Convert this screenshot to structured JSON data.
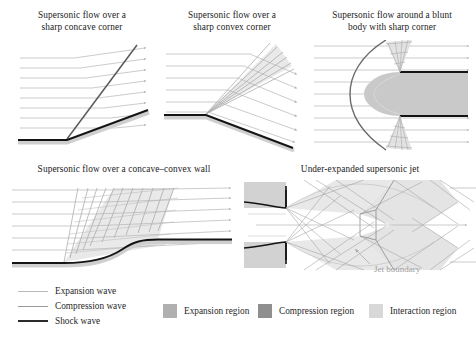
{
  "figure": {
    "background": "#ffffff",
    "width": 476,
    "height": 344
  },
  "colors": {
    "expansion_wave": "#bfbfbf",
    "compression_wave": "#9d9d9d",
    "shock_wave": "#262626",
    "expansion_region": "#b0b0b0",
    "compression_region": "#8f8f8f",
    "interaction_region": "#d8d8d8",
    "streamline": "#b5b5b5",
    "wall": "#1a1a1a",
    "wall_shadow": "#cccccc",
    "annotation": "#9e9e9e",
    "body_fill": "#c9c9c9",
    "text": "#1f1f1f"
  },
  "panels": [
    {
      "id": "concave-corner",
      "title": "Supersonic flow over a\nsharp concave corner",
      "description": "Oblique shock wave generated at a sharp concave corner; horizontal incoming streamlines are deflected upward across the shock."
    },
    {
      "id": "convex-corner",
      "title": "Supersonic flow over a\nsharp convex corner",
      "description": "Prandtl-Meyer expansion fan at a sharp convex corner; streamlines turn downward through the centred expansion wave."
    },
    {
      "id": "blunt-body",
      "title": "Supersonic flow around a blunt\nbody with sharp corner",
      "description": "Detached bow shock ahead of a blunt body, with expansion fans at the two sharp shoulders."
    },
    {
      "id": "concave-convex-wall",
      "title": "Supersonic flow over a concave–convex wall",
      "description": "Compression waves coalesce over the concave part of the wall and expansion waves spread over the convex part."
    },
    {
      "id": "underexpanded-jet",
      "title": "Under-expanded supersonic jet",
      "description": "Shock-cell structure of an under-expanded jet issuing from a nozzle, with repeated expansion and compression regions bounded by the jet boundary."
    }
  ],
  "annotations": {
    "jet_boundary": "Jet boundary"
  },
  "legend": {
    "lines": [
      {
        "label": "Expansion wave",
        "style": "expansion-wave-line"
      },
      {
        "label": "Compression wave",
        "style": "compression-wave-line"
      },
      {
        "label": "Shock wave",
        "style": "shock-wave-line"
      }
    ],
    "swatches": [
      {
        "label": "Expansion region",
        "color": "#b0b0b0"
      },
      {
        "label": "Compression region",
        "color": "#8f8f8f"
      },
      {
        "label": "Interaction region",
        "color": "#d8d8d8"
      }
    ]
  }
}
